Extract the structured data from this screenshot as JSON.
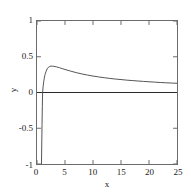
{
  "chart_data": {
    "type": "line",
    "title": "",
    "xlabel": "x",
    "ylabel": "y",
    "xlim": [
      0,
      25
    ],
    "ylim": [
      -1,
      1
    ],
    "xticks": [
      0,
      5,
      10,
      15,
      20,
      25
    ],
    "yticks": [
      1,
      0.5,
      0,
      -0.5,
      -1
    ],
    "xtick_labels": [
      "0",
      "5",
      "10",
      "15",
      "20",
      "25"
    ],
    "ytick_labels": [
      "1",
      "0.5",
      "0",
      "-0.5",
      "-1"
    ],
    "grid": false,
    "legend": null,
    "series": [
      {
        "name": "curve",
        "color": "#555555",
        "x": [
          0.8,
          0.85,
          0.9,
          0.95,
          1.0,
          1.1,
          1.2,
          1.3,
          1.4,
          1.5,
          1.6,
          1.8,
          2.0,
          2.2,
          2.5,
          2.72,
          3.0,
          3.5,
          4.0,
          4.5,
          5.0,
          6.0,
          7.0,
          8.0,
          9.0,
          10.0,
          11.0,
          12.0,
          13.0,
          14.0,
          15.0,
          16.0,
          17.0,
          18.0,
          19.0,
          20.0,
          21.0,
          22.0,
          23.0,
          24.0,
          25.0
        ],
        "y": [
          -1.0,
          -0.72,
          -0.45,
          -0.2,
          0.0,
          0.09,
          0.15,
          0.2,
          0.24,
          0.27,
          0.29,
          0.33,
          0.35,
          0.36,
          0.37,
          0.368,
          0.366,
          0.358,
          0.347,
          0.334,
          0.322,
          0.299,
          0.278,
          0.26,
          0.244,
          0.23,
          0.218,
          0.207,
          0.197,
          0.188,
          0.181,
          0.173,
          0.167,
          0.161,
          0.155,
          0.15,
          0.145,
          0.14,
          0.136,
          0.132,
          0.129
        ]
      },
      {
        "name": "zero-line",
        "color": "#2a2a2a",
        "x": [
          0,
          25
        ],
        "y": [
          0,
          0
        ]
      }
    ]
  },
  "axes": {
    "frame_color": "#6b6b6b",
    "tick_color": "#6b6b6b"
  }
}
